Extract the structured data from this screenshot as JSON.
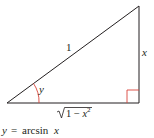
{
  "diagram": {
    "type": "right-triangle",
    "vertices": {
      "left": [
        7,
        103
      ],
      "right_angle": [
        139,
        103
      ],
      "top": [
        139,
        6
      ]
    },
    "labels": {
      "hypotenuse": "1",
      "opposite": "x",
      "angle": "y",
      "adjacent_radical": "1 − x",
      "adjacent_exponent": "2"
    },
    "caption": {
      "lhs": "y",
      "equals": "=",
      "func": "arcsin",
      "arg": "x"
    },
    "colors": {
      "lines": "#231f20",
      "angle_marks": "#d9443a",
      "text": "#231f20"
    }
  }
}
